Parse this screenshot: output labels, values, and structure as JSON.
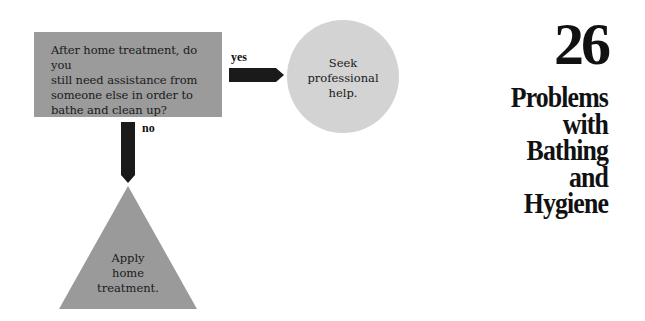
{
  "chapter": {
    "number": "26",
    "title_lines": [
      "Problems",
      "with",
      "Bathing",
      "and",
      "Hygiene"
    ]
  },
  "flowchart": {
    "question": {
      "shape": "rectangle",
      "lines": [
        "After home treatment, do you",
        "still need assistance from",
        "someone else in order to",
        "bathe and clean up?"
      ]
    },
    "yes_branch": {
      "label": "yes",
      "outcome_shape": "circle",
      "outcome_lines": [
        "Seek",
        "professional",
        "help."
      ]
    },
    "no_branch": {
      "label": "no",
      "outcome_shape": "triangle",
      "outcome_lines": [
        "Apply",
        "home",
        "treatment."
      ]
    }
  },
  "colors": {
    "question_box": "#9b9b9b",
    "circle": "#d3d3d3",
    "triangle": "#9a9a9a",
    "arrow": "#1a1a1a"
  }
}
